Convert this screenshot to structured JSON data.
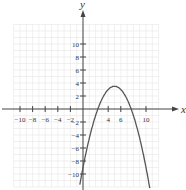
{
  "chart_data": {
    "type": "line",
    "title": "",
    "xlabel": "x",
    "ylabel": "y",
    "xlim": [
      -11,
      12
    ],
    "ylim": [
      -12,
      14
    ],
    "grid": true,
    "x_ticks": [
      -10,
      -8,
      -6,
      -4,
      -2,
      4,
      6,
      10
    ],
    "y_ticks": [
      10,
      8,
      6,
      4,
      2,
      -2,
      -4,
      -6,
      -8,
      -10
    ],
    "series": [
      {
        "name": "parabola",
        "equation": "y = -0.5(x-5)^2 + 3.5",
        "x": [
          0,
          2,
          4,
          5,
          6,
          8,
          10
        ],
        "y": [
          -9,
          -1,
          3,
          3.5,
          3,
          -1,
          -9
        ]
      }
    ]
  }
}
